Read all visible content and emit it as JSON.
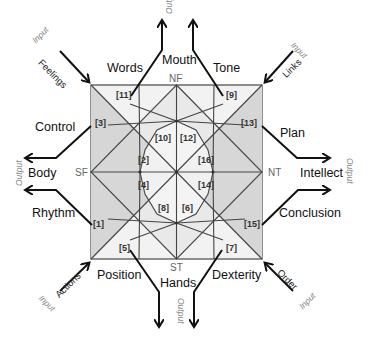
{
  "diagram": {
    "poles": {
      "top": "NF",
      "right": "NT",
      "bottom": "ST",
      "left": "SF"
    },
    "regions": [
      "[1]",
      "[2]",
      "[3]",
      "[4]",
      "[5]",
      "[6]",
      "[7]",
      "[8]",
      "[9]",
      "[10]",
      "[11]",
      "[12]",
      "[13]",
      "[14]",
      "[15]",
      "[16]"
    ],
    "outputs": {
      "top_left": "Words",
      "top_center": "Mouth",
      "top_right": "Tone",
      "right_top": "Plan",
      "right_center": "Intellect",
      "right_bottom": "Conclusion",
      "bottom_right": "Dexterity",
      "bottom_center": "Hands",
      "bottom_left": "Position",
      "left_bottom": "Rhythm",
      "left_center": "Body",
      "left_top": "Control"
    },
    "output_tag": "Output",
    "inputs": {
      "top_left": "Feelings",
      "top_right": "Links",
      "bottom_right": "Order",
      "bottom_left": "Actions"
    },
    "input_tag": "Input",
    "colors": {
      "light": "#f1f1f1",
      "mid": "#d9d9d9",
      "dark": "#c8c8c8",
      "line": "#444444",
      "arrow": "#111111"
    }
  }
}
